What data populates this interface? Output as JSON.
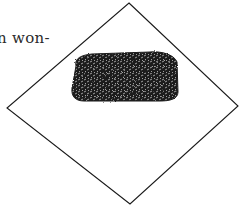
{
  "page": {
    "text_fragment": "n won-"
  },
  "illustration": {
    "description": "Diamond-shaped square sheet with a dark textured rectangular patch in the upper half",
    "stroke_color": "#1a1a1a",
    "patch_color": "#1c1c1c",
    "background": "#ffffff"
  }
}
